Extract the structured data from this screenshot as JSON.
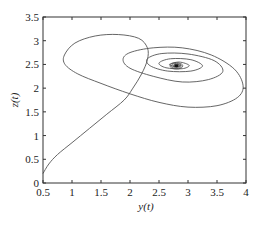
{
  "chart_data": {
    "type": "line",
    "title": "",
    "xlabel": "y(t)",
    "ylabel": "z(t)",
    "xlim": [
      0.5,
      4
    ],
    "ylim": [
      0,
      3.5
    ],
    "xticks": [
      "0.5",
      "1",
      "1.5",
      "2",
      "2.5",
      "3",
      "3.5",
      "4"
    ],
    "yticks": [
      "0",
      "0.5",
      "1",
      "1.5",
      "2",
      "2.5",
      "3",
      "3.5"
    ],
    "grid": false,
    "legend": null,
    "series": [
      {
        "name": "phase trajectory (y(t), z(t))",
        "color": "#555555",
        "description": "Trajectory starting near (0.5, 0.2), rising, looping in a large ellipse, then spiraling inward to a stable focus near (2.8, 2.45)",
        "points": [
          [
            0.5,
            0.2
          ],
          [
            0.6,
            0.4
          ],
          [
            0.75,
            0.6
          ],
          [
            1.0,
            0.85
          ],
          [
            1.3,
            1.15
          ],
          [
            1.6,
            1.45
          ],
          [
            1.9,
            1.75
          ],
          [
            2.05,
            2.0
          ],
          [
            2.2,
            2.3
          ],
          [
            2.3,
            2.6
          ],
          [
            2.3,
            2.85
          ],
          [
            2.15,
            3.05
          ],
          [
            1.8,
            3.13
          ],
          [
            1.4,
            3.1
          ],
          [
            1.05,
            2.95
          ],
          [
            0.87,
            2.7
          ],
          [
            0.88,
            2.5
          ],
          [
            1.1,
            2.3
          ],
          [
            1.5,
            2.1
          ],
          [
            2.0,
            1.88
          ],
          [
            2.5,
            1.7
          ],
          [
            3.0,
            1.6
          ],
          [
            3.5,
            1.63
          ],
          [
            3.85,
            1.8
          ],
          [
            3.95,
            2.05
          ],
          [
            3.8,
            2.4
          ],
          [
            3.4,
            2.7
          ],
          [
            2.9,
            2.85
          ],
          [
            2.4,
            2.85
          ],
          [
            2.0,
            2.75
          ],
          [
            1.88,
            2.6
          ],
          [
            2.0,
            2.42
          ],
          [
            2.4,
            2.25
          ],
          [
            2.9,
            2.13
          ],
          [
            3.35,
            2.18
          ],
          [
            3.6,
            2.35
          ],
          [
            3.45,
            2.58
          ],
          [
            3.0,
            2.72
          ],
          [
            2.55,
            2.73
          ],
          [
            2.3,
            2.62
          ],
          [
            2.35,
            2.47
          ],
          [
            2.65,
            2.36
          ],
          [
            3.05,
            2.36
          ],
          [
            3.25,
            2.47
          ],
          [
            3.05,
            2.6
          ],
          [
            2.7,
            2.62
          ],
          [
            2.5,
            2.53
          ],
          [
            2.62,
            2.43
          ],
          [
            2.9,
            2.41
          ],
          [
            3.02,
            2.48
          ],
          [
            2.85,
            2.55
          ],
          [
            2.68,
            2.5
          ],
          [
            2.8,
            2.45
          ],
          [
            2.88,
            2.48
          ],
          [
            2.78,
            2.5
          ],
          [
            2.8,
            2.47
          ]
        ]
      }
    ],
    "equilibrium": [
      2.8,
      2.47
    ]
  },
  "axes": {
    "xlabel": "y(t)",
    "ylabel": "z(t)"
  }
}
